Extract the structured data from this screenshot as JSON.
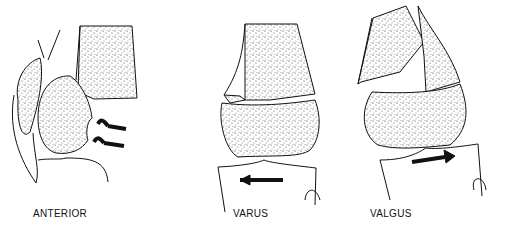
{
  "figure": {
    "panels": [
      {
        "id": "anterior",
        "label": "ANTERIOR",
        "arrows": 2,
        "arrow_direction": "left"
      },
      {
        "id": "varus",
        "label": "VARUS",
        "arrows": 1,
        "arrow_direction": "left"
      },
      {
        "id": "valgus",
        "label": "VALGUS",
        "arrows": 1,
        "arrow_direction": "right"
      }
    ],
    "colors": {
      "ink": "#111111",
      "background": "#ffffff",
      "stipple": "#444444"
    }
  }
}
